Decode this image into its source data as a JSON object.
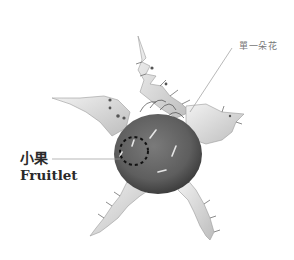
{
  "figure": {
    "colors": {
      "background": "#ffffff",
      "fruit": "#6a6a6a",
      "fruit_dark": "#4a4a4a",
      "sepal": "#d6d6d6",
      "sepal_edge": "#9a9a9a",
      "leader_line": "#9a9a9a",
      "dashed_circle": "#111111"
    }
  },
  "labels": {
    "flower": {
      "text": "單一朵花"
    },
    "fruitlet": {
      "zh": "小果",
      "en": "Fruitlet"
    }
  }
}
